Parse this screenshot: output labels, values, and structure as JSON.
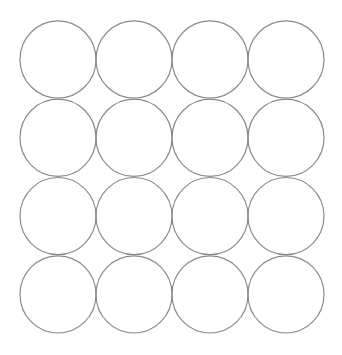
{
  "diagram": {
    "rows": 4,
    "columns": 4,
    "shape": "circle",
    "stroke_color": "#8a8a8a",
    "fill_color": "none",
    "background_color": "#ffffff"
  }
}
